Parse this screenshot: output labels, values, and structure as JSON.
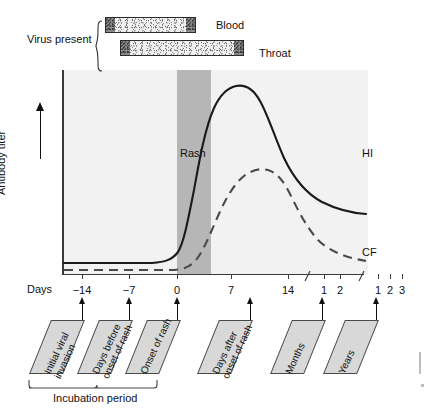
{
  "figure": {
    "title_text": "Antibody response and virus presence timeline"
  },
  "virus": {
    "bracket_label": "Virus present",
    "bars": [
      {
        "name": "Blood",
        "label": "Blood"
      },
      {
        "name": "Throat",
        "label": "Throat"
      }
    ]
  },
  "plot": {
    "y_axis_label": "Antibody titer",
    "rash_band_label": "Rash",
    "curve_labels": {
      "hi": "HI",
      "cf": "CF"
    },
    "background_color": "#f2f2f2",
    "rash_band_color": "#b6b6b6"
  },
  "x_axis": {
    "axis_name": "Days",
    "ticks": [
      {
        "label": "-14",
        "x": 82
      },
      {
        "label": "-7",
        "x": 129
      },
      {
        "label": "0",
        "x": 177
      },
      {
        "label": "7",
        "x": 231
      },
      {
        "label": "14",
        "x": 288
      },
      {
        "label": "1",
        "x": 324
      },
      {
        "label": "2",
        "x": 340
      },
      {
        "label": "1",
        "x": 378
      },
      {
        "label": "2",
        "x": 390
      },
      {
        "label": "3",
        "x": 402
      }
    ],
    "breaks": [
      {
        "x": 303
      },
      {
        "x": 357
      }
    ]
  },
  "callouts": [
    {
      "name": "initial-viral-invasion",
      "text": "Initial viral\ninvasion",
      "x": 40,
      "arrow_x": 82
    },
    {
      "name": "days-before-onset",
      "text": "Days before\nonset of rash",
      "x": 88,
      "arrow_x": 129
    },
    {
      "name": "onset-of-rash",
      "text": "Onset of rash",
      "x": 136,
      "arrow_x": 177
    },
    {
      "name": "days-after-onset",
      "text": "Days after\nonset of rash",
      "x": 208,
      "arrow_x": 250
    },
    {
      "name": "months",
      "text": "Months",
      "x": 281,
      "arrow_x": 322
    },
    {
      "name": "years",
      "text": "Years",
      "x": 334,
      "arrow_x": 376
    }
  ],
  "incubation": {
    "label": "Incubation period"
  },
  "chart_data": {
    "type": "line",
    "xlabel": "Days",
    "ylabel": "Antibody titer",
    "x_tick_labels": [
      "-14",
      "-7",
      "0",
      "7",
      "14",
      "1",
      "2",
      "1",
      "2",
      "3"
    ],
    "x_tick_groups": [
      "days",
      "days",
      "days",
      "days",
      "days",
      "months",
      "months",
      "years",
      "years",
      "years"
    ],
    "axis_breaks_after": [
      "14",
      "2"
    ],
    "grid": false,
    "legend_position": "inline-right-of-curve-ends",
    "annotations": [
      {
        "name": "rash",
        "label": "Rash",
        "type": "vertical-band",
        "x_start_days": 0,
        "x_end_days": 4
      },
      {
        "name": "virus-present-blood",
        "label": "Blood",
        "type": "bar",
        "x_start_days": -12,
        "x_end_days": -1
      },
      {
        "name": "virus-present-throat",
        "label": "Throat",
        "type": "bar",
        "x_start_days": -10,
        "x_end_days": 6
      },
      {
        "name": "incubation-period",
        "label": "Incubation period",
        "type": "bracket",
        "x_start_days": -14,
        "x_end_days": 0
      }
    ],
    "series": [
      {
        "name": "HI",
        "style": "solid",
        "color": "#1a1a1a",
        "points": [
          {
            "x_label": "-14",
            "y": 3
          },
          {
            "x_label": "-7",
            "y": 3
          },
          {
            "x_label": "0",
            "y": 4
          },
          {
            "x_label": "3",
            "y": 14
          },
          {
            "x_label": "5",
            "y": 52
          },
          {
            "x_label": "7",
            "y": 88
          },
          {
            "x_label": "10",
            "y": 99
          },
          {
            "x_label": "14",
            "y": 92
          },
          {
            "x_label": "1mo",
            "y": 72
          },
          {
            "x_label": "2mo",
            "y": 58
          },
          {
            "x_label": "1yr",
            "y": 48
          },
          {
            "x_label": "2yr",
            "y": 44
          },
          {
            "x_label": "3yr",
            "y": 43
          }
        ]
      },
      {
        "name": "CF",
        "style": "dashed",
        "color": "#4a4a4a",
        "points": [
          {
            "x_label": "-14",
            "y": 1
          },
          {
            "x_label": "-7",
            "y": 1
          },
          {
            "x_label": "0",
            "y": 1
          },
          {
            "x_label": "4",
            "y": 3
          },
          {
            "x_label": "7",
            "y": 18
          },
          {
            "x_label": "10",
            "y": 40
          },
          {
            "x_label": "14",
            "y": 55
          },
          {
            "x_label": "18",
            "y": 57
          },
          {
            "x_label": "1mo",
            "y": 45
          },
          {
            "x_label": "2mo",
            "y": 28
          },
          {
            "x_label": "1yr",
            "y": 14
          },
          {
            "x_label": "2yr",
            "y": 10
          },
          {
            "x_label": "3yr",
            "y": 9
          }
        ]
      }
    ]
  }
}
